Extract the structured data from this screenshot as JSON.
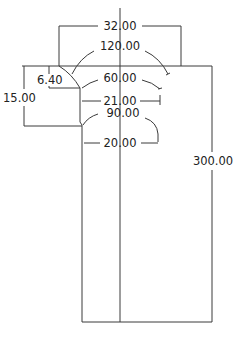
{
  "drawing": {
    "title": "Nozzle / tapered tube profile drawing",
    "units": "mm",
    "line_color": "#3a3a3a",
    "background": "#ffffff",
    "dimensions": {
      "top_width": "32.00",
      "top_angle": "120.00",
      "chamfer_depth": "6.40",
      "total_taper_depth": "15.00",
      "mid_angle": "60.00",
      "mid_width": "21.00",
      "lower_angle": "90.00",
      "tube_width": "20.00",
      "total_length": "300.00"
    }
  }
}
